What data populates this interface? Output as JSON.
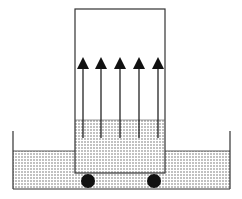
{
  "diagram": {
    "colors": {
      "line": "#333333",
      "fill_dots": "#555555",
      "background": "#ffffff",
      "wheel": "#111111",
      "arrow": "#111111"
    },
    "tank": {
      "left_x": 13,
      "right_x": 230,
      "top_y": 131,
      "bottom_y": 189,
      "liquid_level_y": 151
    },
    "box": {
      "left_x": 75,
      "right_x": 165,
      "top_y": 9,
      "bottom_y": 173,
      "liquid_level_y": 120
    },
    "arrows": {
      "count": 5,
      "x": [
        83,
        101,
        120,
        139,
        158
      ],
      "tip_y": 57,
      "base_y": 69,
      "tail_y": 138
    },
    "wheels": [
      {
        "cx": 88,
        "cy": 181,
        "r": 7
      },
      {
        "cx": 154,
        "cy": 181,
        "r": 7
      }
    ]
  }
}
